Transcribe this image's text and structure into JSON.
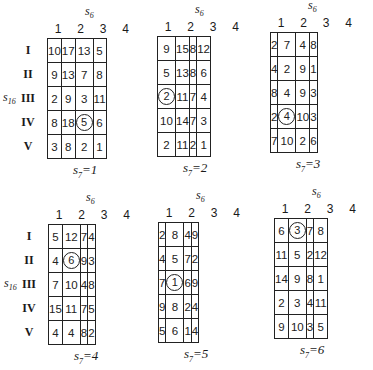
{
  "column_axis": {
    "var": "s",
    "sub": "6",
    "ticks": [
      "1",
      "2",
      "3",
      "4"
    ]
  },
  "row_axis": {
    "var": "s",
    "sub": "16",
    "ticks": [
      "I",
      "II",
      "III",
      "IV",
      "V"
    ]
  },
  "panels": [
    {
      "s7_label": "s",
      "s7_sub": "7",
      "s7_eq": "=1",
      "rows": [
        [
          "10",
          "17",
          "13",
          "5"
        ],
        [
          "9",
          "13",
          "7",
          "8"
        ],
        [
          "2",
          "9",
          "3",
          "11"
        ],
        [
          "8",
          "18",
          "5",
          "6"
        ],
        [
          "3",
          "8",
          "2",
          "1"
        ]
      ],
      "circled": {
        "row": 3,
        "col": 2
      }
    },
    {
      "s7_label": "s",
      "s7_sub": "7",
      "s7_eq": "=2",
      "rows": [
        [
          "9",
          "15",
          "8",
          "12"
        ],
        [
          "5",
          "13",
          "8",
          "6"
        ],
        [
          "2",
          "11",
          "7",
          "4"
        ],
        [
          "10",
          "14",
          "7",
          "3"
        ],
        [
          "2",
          "11",
          "2",
          "1"
        ]
      ],
      "circled": {
        "row": 2,
        "col": 0
      }
    },
    {
      "s7_label": "s",
      "s7_sub": "7",
      "s7_eq": "=3",
      "rows": [
        [
          "2",
          "7",
          "4",
          "8"
        ],
        [
          "4",
          "2",
          "9",
          "1"
        ],
        [
          "8",
          "4",
          "9",
          "3"
        ],
        [
          "2",
          "4",
          "10",
          "3"
        ],
        [
          "7",
          "10",
          "2",
          "6"
        ]
      ],
      "circled": {
        "row": 3,
        "col": 1
      }
    },
    {
      "s7_label": "s",
      "s7_sub": "7",
      "s7_eq": "=4",
      "rows": [
        [
          "5",
          "12",
          "7",
          "4"
        ],
        [
          "4",
          "6",
          "9",
          "3"
        ],
        [
          "7",
          "10",
          "4",
          "8"
        ],
        [
          "15",
          "11",
          "7",
          "5"
        ],
        [
          "4",
          "4",
          "8",
          "2"
        ]
      ],
      "circled": {
        "row": 1,
        "col": 1
      }
    },
    {
      "s7_label": "s",
      "s7_sub": "7",
      "s7_eq": "=5",
      "rows": [
        [
          "2",
          "8",
          "4",
          "9"
        ],
        [
          "4",
          "5",
          "7",
          "2"
        ],
        [
          "7",
          "1",
          "6",
          "9"
        ],
        [
          "9",
          "8",
          "2",
          "4"
        ],
        [
          "5",
          "6",
          "1",
          "4"
        ]
      ],
      "circled": {
        "row": 2,
        "col": 1
      }
    },
    {
      "s7_label": "s",
      "s7_sub": "7",
      "s7_eq": "=6",
      "rows": [
        [
          "6",
          "3",
          "7",
          "8"
        ],
        [
          "11",
          "5",
          "2",
          "12"
        ],
        [
          "14",
          "9",
          "8",
          "1"
        ],
        [
          "2",
          "3",
          "4",
          "11"
        ],
        [
          "9",
          "10",
          "3",
          "5"
        ]
      ],
      "circled": {
        "row": 0,
        "col": 1
      }
    }
  ]
}
